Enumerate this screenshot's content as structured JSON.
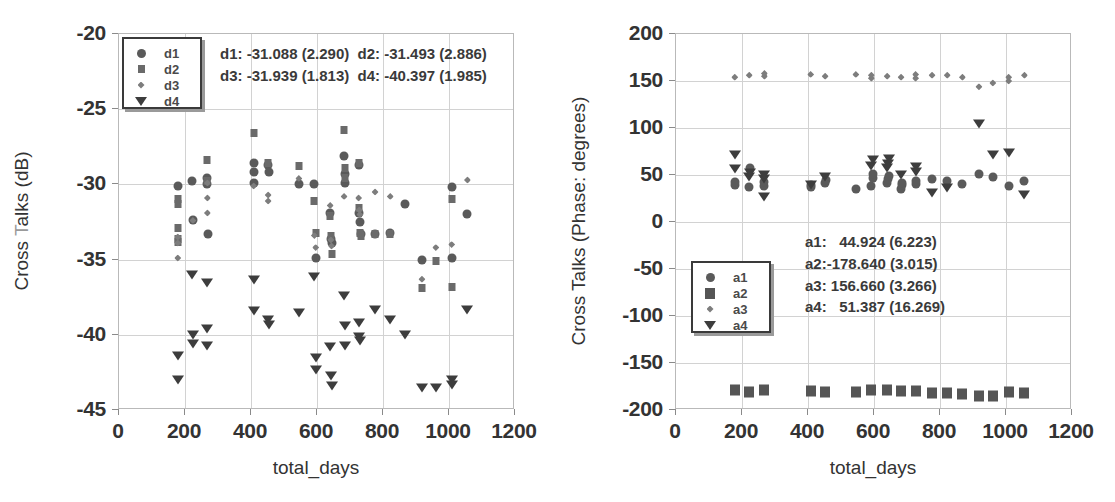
{
  "figure": {
    "panels": [
      {
        "id": "left",
        "axis_title_x": "total_days",
        "axis_title_y_prefix": "Cross ",
        "axis_title_y_faded": "T",
        "axis_title_y_suffix": "alks (dB)",
        "axis_title_y_full": "Cross Talks (dB)",
        "legend": {
          "items": [
            {
              "label": "d1",
              "marker": "circle"
            },
            {
              "label": "d2",
              "marker": "square"
            },
            {
              "label": "d3",
              "marker": "diamond"
            },
            {
              "label": "d4",
              "marker": "triangle-down"
            }
          ]
        },
        "stats_lines": [
          "d1: -31.088 (2.290)  d2: -31.493 (2.886)",
          "d3: -31.939 (1.813)  d4: -40.397 (1.985)"
        ]
      },
      {
        "id": "right",
        "axis_title_x": "total_days",
        "axis_title_y_full": "Cross Talks (Phase: degrees)",
        "legend": {
          "items": [
            {
              "label": "a1",
              "marker": "circle"
            },
            {
              "label": "a2",
              "marker": "big-square"
            },
            {
              "label": "a3",
              "marker": "diamond"
            },
            {
              "label": "a4",
              "marker": "triangle-down"
            }
          ]
        },
        "stats_lines": [
          "a1:   44.924 (6.223)",
          "a2:-178.640 (3.015)",
          "a3: 156.660 (3.266)",
          "a4:   51.387 (16.269)"
        ]
      }
    ]
  },
  "chart_data": [
    {
      "type": "scatter",
      "title": "",
      "xlabel": "total_days",
      "ylabel": "Cross Talks (dB)",
      "xlim": [
        0,
        1200
      ],
      "ylim": [
        -45,
        -20
      ],
      "xticks": [
        0,
        200,
        400,
        600,
        800,
        1000,
        1200
      ],
      "yticks": [
        -45,
        -40,
        -35,
        -30,
        -25,
        -20
      ],
      "grid": true,
      "legend_position": "top-left",
      "annotations": [
        "d1: -31.088 (2.290)  d2: -31.493 (2.886)",
        "d3: -31.939 (1.813)  d4: -40.397 (1.985)"
      ],
      "series": [
        {
          "name": "d1",
          "marker": "circle",
          "mean": -31.088,
          "sd": 2.29,
          "points": [
            [
              178,
              -30.1
            ],
            [
              222,
              -29.8
            ],
            [
              224,
              -32.4
            ],
            [
              268,
              -30.0
            ],
            [
              268,
              -29.6
            ],
            [
              270,
              -33.3
            ],
            [
              408,
              -28.6
            ],
            [
              408,
              -29.2
            ],
            [
              410,
              -29.9
            ],
            [
              452,
              -28.7
            ],
            [
              455,
              -29.2
            ],
            [
              545,
              -30.0
            ],
            [
              592,
              -30.0
            ],
            [
              596,
              -34.9
            ],
            [
              640,
              -31.9
            ],
            [
              642,
              -33.6
            ],
            [
              644,
              -33.9
            ],
            [
              682,
              -28.1
            ],
            [
              684,
              -29.3
            ],
            [
              686,
              -29.9
            ],
            [
              726,
              -28.7
            ],
            [
              728,
              -31.9
            ],
            [
              730,
              -32.5
            ],
            [
              732,
              -33.3
            ],
            [
              776,
              -33.3
            ],
            [
              822,
              -33.2
            ],
            [
              868,
              -31.3
            ],
            [
              918,
              -35.0
            ],
            [
              1008,
              -30.2
            ],
            [
              1010,
              -34.9
            ],
            [
              1056,
              -32.0
            ]
          ]
        },
        {
          "name": "d2",
          "marker": "square",
          "mean": -31.493,
          "sd": 2.886,
          "points": [
            [
              178,
              -31.0
            ],
            [
              178,
              -31.3
            ],
            [
              178,
              -32.9
            ],
            [
              178,
              -33.6
            ],
            [
              178,
              -33.8
            ],
            [
              268,
              -28.4
            ],
            [
              268,
              -29.8
            ],
            [
              408,
              -26.6
            ],
            [
              452,
              -28.6
            ],
            [
              545,
              -28.8
            ],
            [
              592,
              -31.1
            ],
            [
              596,
              -33.2
            ],
            [
              640,
              -32.1
            ],
            [
              642,
              -33.4
            ],
            [
              644,
              -34.6
            ],
            [
              682,
              -26.4
            ],
            [
              684,
              -28.9
            ],
            [
              686,
              -29.6
            ],
            [
              726,
              -28.6
            ],
            [
              728,
              -31.6
            ],
            [
              730,
              -33.2
            ],
            [
              732,
              -33.4
            ],
            [
              776,
              -33.3
            ],
            [
              822,
              -33.3
            ],
            [
              918,
              -36.9
            ],
            [
              960,
              -35.1
            ],
            [
              1008,
              -31.0
            ],
            [
              1010,
              -36.8
            ]
          ]
        },
        {
          "name": "d3",
          "marker": "diamond",
          "mean": -31.939,
          "sd": 1.813,
          "points": [
            [
              178,
              -33.5
            ],
            [
              178,
              -33.9
            ],
            [
              178,
              -34.9
            ],
            [
              224,
              -32.4
            ],
            [
              268,
              -30.9
            ],
            [
              268,
              -31.9
            ],
            [
              268,
              -29.9
            ],
            [
              408,
              -30.1
            ],
            [
              452,
              -30.7
            ],
            [
              452,
              -31.1
            ],
            [
              545,
              -29.6
            ],
            [
              592,
              -33.4
            ],
            [
              596,
              -34.2
            ],
            [
              640,
              -31.4
            ],
            [
              642,
              -33.7
            ],
            [
              644,
              -34.1
            ],
            [
              682,
              -30.8
            ],
            [
              726,
              -30.9
            ],
            [
              728,
              -31.7
            ],
            [
              730,
              -32.0
            ],
            [
              776,
              -30.5
            ],
            [
              822,
              -30.8
            ],
            [
              918,
              -36.3
            ],
            [
              960,
              -34.2
            ],
            [
              1008,
              -34.0
            ],
            [
              1056,
              -29.7
            ]
          ]
        },
        {
          "name": "d4",
          "marker": "triangle-down",
          "mean": -40.397,
          "sd": 1.985,
          "points": [
            [
              178,
              -41.5
            ],
            [
              178,
              -43.1
            ],
            [
              222,
              -36.1
            ],
            [
              224,
              -40.1
            ],
            [
              224,
              -40.7
            ],
            [
              268,
              -36.6
            ],
            [
              268,
              -39.7
            ],
            [
              268,
              -40.8
            ],
            [
              408,
              -36.4
            ],
            [
              410,
              -38.5
            ],
            [
              452,
              -39.1
            ],
            [
              455,
              -39.4
            ],
            [
              545,
              -38.6
            ],
            [
              592,
              -36.2
            ],
            [
              596,
              -41.6
            ],
            [
              596,
              -42.4
            ],
            [
              640,
              -40.9
            ],
            [
              642,
              -42.8
            ],
            [
              644,
              -43.5
            ],
            [
              682,
              -37.5
            ],
            [
              684,
              -39.5
            ],
            [
              686,
              -40.8
            ],
            [
              726,
              -39.3
            ],
            [
              728,
              -40.2
            ],
            [
              730,
              -40.5
            ],
            [
              776,
              -38.4
            ],
            [
              822,
              -39.1
            ],
            [
              868,
              -40.1
            ],
            [
              918,
              -43.6
            ],
            [
              960,
              -43.6
            ],
            [
              1008,
              -43.1
            ],
            [
              1010,
              -43.4
            ],
            [
              1056,
              -38.4
            ]
          ]
        }
      ]
    },
    {
      "type": "scatter",
      "title": "",
      "xlabel": "total_days",
      "ylabel": "Cross Talks (Phase: degrees)",
      "xlim": [
        0,
        1200
      ],
      "ylim": [
        -200,
        200
      ],
      "xticks": [
        0,
        200,
        400,
        600,
        800,
        1000,
        1200
      ],
      "yticks": [
        -200,
        -150,
        -100,
        -50,
        0,
        50,
        100,
        150,
        200
      ],
      "grid": true,
      "legend_position": "lower-left",
      "annotations": [
        "a1:   44.924 (6.223)",
        "a2:-178.640 (3.015)",
        "a3: 156.660 (3.266)",
        "a4:   51.387 (16.269)"
      ],
      "series": [
        {
          "name": "a1",
          "marker": "circle",
          "mean": 44.924,
          "sd": 6.223,
          "points": [
            [
              178,
              39
            ],
            [
              178,
              43
            ],
            [
              222,
              37
            ],
            [
              224,
              57
            ],
            [
              268,
              38
            ],
            [
              268,
              43
            ],
            [
              408,
              37
            ],
            [
              410,
              39
            ],
            [
              452,
              42
            ],
            [
              455,
              45
            ],
            [
              545,
              35
            ],
            [
              592,
              38
            ],
            [
              596,
              47
            ],
            [
              596,
              51
            ],
            [
              640,
              41
            ],
            [
              642,
              46
            ],
            [
              644,
              49
            ],
            [
              682,
              35
            ],
            [
              684,
              39
            ],
            [
              686,
              42
            ],
            [
              726,
              40
            ],
            [
              728,
              44
            ],
            [
              776,
              46
            ],
            [
              822,
              44
            ],
            [
              868,
              40
            ],
            [
              918,
              51
            ],
            [
              960,
              48
            ],
            [
              1008,
              38
            ],
            [
              1056,
              44
            ]
          ]
        },
        {
          "name": "a2",
          "marker": "big-square",
          "mean": -178.64,
          "sd": 3.015,
          "points": [
            [
              178,
              -179
            ],
            [
              222,
              -181
            ],
            [
              268,
              -179
            ],
            [
              408,
              -180
            ],
            [
              452,
              -181
            ],
            [
              545,
              -181
            ],
            [
              592,
              -179
            ],
            [
              640,
              -179
            ],
            [
              682,
              -180
            ],
            [
              726,
              -180
            ],
            [
              776,
              -182
            ],
            [
              822,
              -182
            ],
            [
              868,
              -183
            ],
            [
              918,
              -185
            ],
            [
              960,
              -185
            ],
            [
              1008,
              -181
            ],
            [
              1056,
              -182
            ]
          ]
        },
        {
          "name": "a3",
          "marker": "diamond",
          "mean": 156.66,
          "sd": 3.266,
          "points": [
            [
              178,
              154
            ],
            [
              222,
              156
            ],
            [
              268,
              155
            ],
            [
              268,
              158
            ],
            [
              408,
              157
            ],
            [
              452,
              155
            ],
            [
              545,
              157
            ],
            [
              592,
              153
            ],
            [
              592,
              156
            ],
            [
              640,
              155
            ],
            [
              682,
              154
            ],
            [
              726,
              153
            ],
            [
              726,
              157
            ],
            [
              776,
              156
            ],
            [
              822,
              156
            ],
            [
              868,
              154
            ],
            [
              918,
              144
            ],
            [
              960,
              148
            ],
            [
              1008,
              150
            ],
            [
              1008,
              154
            ],
            [
              1056,
              156
            ]
          ]
        },
        {
          "name": "a4",
          "marker": "triangle-down",
          "mean": 51.387,
          "sd": 16.269,
          "points": [
            [
              178,
              55
            ],
            [
              178,
              70
            ],
            [
              222,
              47
            ],
            [
              224,
              51
            ],
            [
              268,
              26
            ],
            [
              268,
              45
            ],
            [
              268,
              49
            ],
            [
              408,
              38
            ],
            [
              452,
              47
            ],
            [
              592,
              58
            ],
            [
              596,
              65
            ],
            [
              640,
              56
            ],
            [
              642,
              61
            ],
            [
              644,
              66
            ],
            [
              682,
              49
            ],
            [
              726,
              52
            ],
            [
              728,
              57
            ],
            [
              776,
              30
            ],
            [
              822,
              35
            ],
            [
              918,
              103
            ],
            [
              960,
              70
            ],
            [
              1008,
              72
            ],
            [
              1056,
              28
            ]
          ]
        }
      ]
    }
  ]
}
